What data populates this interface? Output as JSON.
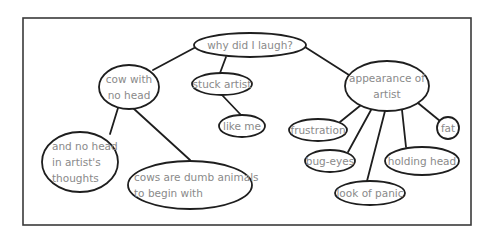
{
  "title": "why did I laugh?",
  "nodes": [
    {
      "id": "root",
      "lines": [
        "why did I laugh?"
      ]
    },
    {
      "id": "cow",
      "lines": [
        "cow with",
        "no head"
      ]
    },
    {
      "id": "stuck",
      "lines": [
        "stuck artist"
      ]
    },
    {
      "id": "likeme",
      "lines": [
        "like me"
      ]
    },
    {
      "id": "appearance",
      "lines": [
        "appearance of",
        "artist"
      ]
    },
    {
      "id": "thoughts",
      "lines": [
        "and no head",
        "in artist's",
        "thoughts"
      ]
    },
    {
      "id": "dumb",
      "lines": [
        "cows are dumb animals",
        "to begin with"
      ]
    },
    {
      "id": "frustration",
      "lines": [
        "frustration"
      ]
    },
    {
      "id": "bugeyes",
      "lines": [
        "bug-eyes"
      ]
    },
    {
      "id": "panic",
      "lines": [
        "look of panic"
      ]
    },
    {
      "id": "holding",
      "lines": [
        "holding head"
      ]
    },
    {
      "id": "fat",
      "lines": [
        "fat"
      ]
    }
  ],
  "edges": [
    [
      "root",
      "cow"
    ],
    [
      "root",
      "stuck"
    ],
    [
      "root",
      "appearance"
    ],
    [
      "stuck",
      "likeme"
    ],
    [
      "cow",
      "thoughts"
    ],
    [
      "cow",
      "dumb"
    ],
    [
      "appearance",
      "frustration"
    ],
    [
      "appearance",
      "bugeyes"
    ],
    [
      "appearance",
      "panic"
    ],
    [
      "appearance",
      "holding"
    ],
    [
      "appearance",
      "fat"
    ]
  ]
}
